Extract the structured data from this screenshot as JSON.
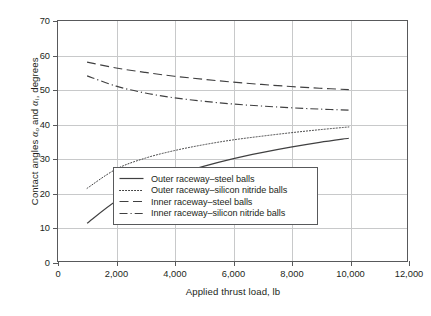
{
  "chart_data": {
    "type": "line",
    "title": "",
    "xlabel": "Applied thrust load, lb",
    "ylabel": "Contact angles αo and αi, degrees",
    "ylabel_parts": {
      "prefix": "Contact angles ",
      "sym1": "α",
      "sub1": "o",
      "middle": " and ",
      "sym2": "α",
      "sub2": "i",
      "suffix": ", degrees"
    },
    "xlim": [
      0,
      12000
    ],
    "ylim": [
      0,
      70
    ],
    "xticks": [
      0,
      2000,
      4000,
      6000,
      8000,
      10000,
      12000
    ],
    "xticklabels": [
      "0",
      "2,000",
      "4,000",
      "6,000",
      "8,000",
      "10,000",
      "12,000"
    ],
    "yticks": [
      0,
      10,
      20,
      30,
      40,
      50,
      60,
      70
    ],
    "yticklabels": [
      "0",
      "10",
      "20",
      "30",
      "40",
      "50",
      "60",
      "70"
    ],
    "grid": true,
    "legend_position": "lower-center-right",
    "x": [
      1000,
      2000,
      3000,
      4000,
      5000,
      6000,
      7000,
      8000,
      9000,
      10000
    ],
    "series": [
      {
        "name": "Outer raceway–steel balls",
        "style": "solid",
        "color": "#404041",
        "values": [
          11.0,
          17.5,
          21.8,
          25.0,
          27.6,
          29.8,
          31.6,
          33.2,
          34.6,
          35.8
        ]
      },
      {
        "name": "Outer raceway–silicon nitride balls",
        "style": "dotted",
        "color": "#404041",
        "values": [
          21.2,
          26.8,
          30.0,
          32.2,
          33.9,
          35.3,
          36.4,
          37.4,
          38.3,
          39.1
        ]
      },
      {
        "name": "Inner raceway–steel balls",
        "style": "dashed",
        "color": "#404041",
        "values": [
          58.0,
          56.3,
          55.0,
          53.9,
          53.0,
          52.2,
          51.5,
          50.9,
          50.4,
          50.0
        ]
      },
      {
        "name": "Inner raceway–silicon nitride balls",
        "style": "dashdot",
        "color": "#404041",
        "values": [
          54.0,
          51.0,
          49.0,
          47.6,
          46.6,
          45.8,
          45.2,
          44.7,
          44.3,
          44.0
        ]
      }
    ]
  },
  "legend": {
    "items": [
      {
        "label": "Outer raceway–steel balls",
        "style": "solid"
      },
      {
        "label": "Outer raceway–silicon nitride balls",
        "style": "dotted"
      },
      {
        "label": "Inner raceway–steel balls",
        "style": "dashed"
      },
      {
        "label": "Inner raceway–silicon nitride balls",
        "style": "dashdot"
      }
    ]
  },
  "colors": {
    "axis": "#58595b",
    "grid": "#c8c9ca",
    "curve": "#404041",
    "text": "#231f20",
    "background": "#ffffff"
  }
}
